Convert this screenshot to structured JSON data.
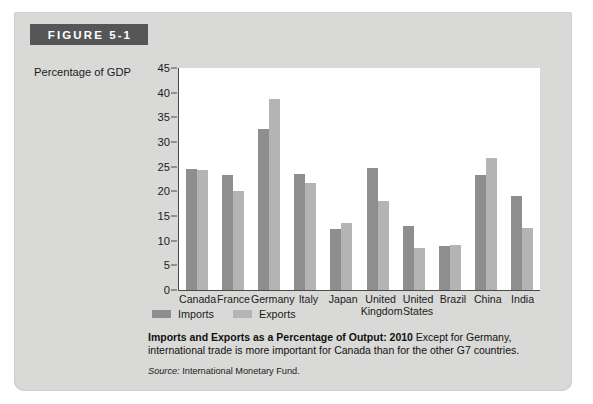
{
  "figure": {
    "banner_label": "FIGURE 5-1",
    "banner_color": "#565659",
    "panel_color": "#d9d9d7"
  },
  "caption": {
    "lead": "Imports and Exports as a Percentage of Output: 2010",
    "body": "Except for Germany, international trade is more important for Canada than for the other G7 countries.",
    "source_label": "Source:",
    "source_text": "International Monetary Fund."
  },
  "chart_data": {
    "type": "bar",
    "title": "Imports and Exports as a Percentage of Output: 2010",
    "xlabel": "",
    "ylabel": "Percentage of GDP",
    "ylim": [
      0,
      45
    ],
    "yticks": [
      0,
      5,
      10,
      15,
      20,
      25,
      30,
      35,
      40,
      45
    ],
    "grid": false,
    "legend_position": "bottom-left",
    "categories": [
      "Canada",
      "France",
      "Germany",
      "Italy",
      "Japan",
      "United Kingdom",
      "United States",
      "Brazil",
      "China",
      "India"
    ],
    "category_lines": [
      [
        "Canada"
      ],
      [
        "France"
      ],
      [
        "Germany"
      ],
      [
        "Italy"
      ],
      [
        "Japan"
      ],
      [
        "United",
        "Kingdom"
      ],
      [
        "United",
        "States"
      ],
      [
        "Brazil"
      ],
      [
        "China"
      ],
      [
        "India"
      ]
    ],
    "series": [
      {
        "name": "Imports",
        "color": "#8e8e8e",
        "values": [
          24.6,
          23.4,
          32.6,
          23.5,
          12.4,
          24.7,
          13.0,
          9.0,
          23.4,
          19.0
        ]
      },
      {
        "name": "Exports",
        "color": "#b4b4b4",
        "values": [
          24.4,
          20.1,
          38.7,
          21.6,
          13.5,
          18.0,
          8.5,
          9.2,
          26.7,
          12.5
        ]
      }
    ]
  }
}
